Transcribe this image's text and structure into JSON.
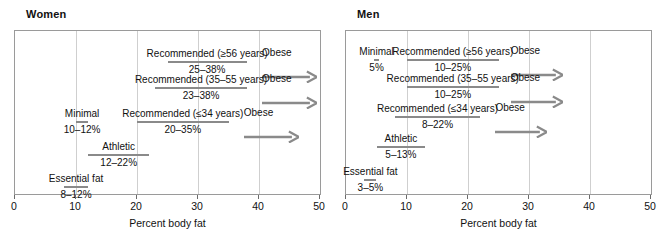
{
  "figure": {
    "axis_title": "Percent body fat",
    "x_ticks": [
      0,
      10,
      20,
      30,
      40,
      50
    ],
    "x_tick_labels": [
      "0",
      "10",
      "20",
      "30",
      "40",
      "50"
    ],
    "gridlines": [
      10,
      20,
      30,
      40
    ],
    "bar_color": "#8a8a8a",
    "frame_color": "#9a9a9a",
    "grid_color": "#cfcfcf"
  },
  "panels": [
    {
      "title": "Women",
      "rows": [
        {
          "label": "Recommended (≥56 years)",
          "value": "25–38%",
          "start": 25,
          "end": 38,
          "obese_label": "Obese",
          "obese_start": 40.5,
          "obese_end": 49.5
        },
        {
          "label": "Recommended (35–55 years)",
          "value": "23–38%",
          "start": 23,
          "end": 38,
          "obese_label": "Obese",
          "obese_start": 40.5,
          "obese_end": 49.5
        },
        {
          "label": "Minimal",
          "value": "10–12%",
          "start": 10,
          "end": 12
        },
        {
          "label": "Recommended (≤34 years)",
          "value": "20–35%",
          "start": 20,
          "end": 35,
          "obese_label": "Obese",
          "obese_start": 37.5,
          "obese_end": 46.5
        },
        {
          "label": "Athletic",
          "value": "12–22%",
          "start": 12,
          "end": 22
        },
        {
          "label": "Essential fat",
          "value": "8–12%",
          "start": 8,
          "end": 12
        }
      ]
    },
    {
      "title": "Men",
      "rows": [
        {
          "label": "Minimal",
          "value": "5%",
          "start": 4.6,
          "end": 5.4
        },
        {
          "label": "Recommended (≥56 years)",
          "value": "10–25%",
          "start": 10,
          "end": 25,
          "obese_label": "Obese",
          "obese_start": 27,
          "obese_end": 35.5
        },
        {
          "label": "Recommended (35–55 years)",
          "value": "10–25%",
          "start": 10,
          "end": 25,
          "obese_label": "Obese",
          "obese_start": 27,
          "obese_end": 35.5
        },
        {
          "label": "Recommended (≤34 years)",
          "value": "8–22%",
          "start": 8,
          "end": 22,
          "obese_label": "Obese",
          "obese_start": 24.5,
          "obese_end": 33
        },
        {
          "label": "Athletic",
          "value": "5–13%",
          "start": 5,
          "end": 13
        },
        {
          "label": "Essential fat",
          "value": "3–5%",
          "start": 3,
          "end": 5
        }
      ]
    }
  ],
  "chart_data": {
    "type": "bar",
    "subtitle": "",
    "xlabel": "Percent body fat",
    "ylabel": "",
    "xlim": [
      0,
      50
    ],
    "grid": true,
    "legend": "none",
    "orientation": "horizontal-ranges",
    "panels": [
      {
        "name": "Women",
        "ranges": [
          {
            "category": "Recommended (≥56 years)",
            "low": 25,
            "high": 38,
            "label": "25–38%"
          },
          {
            "category": "Recommended (35–55 years)",
            "low": 23,
            "high": 38,
            "label": "23–38%"
          },
          {
            "category": "Minimal",
            "low": 10,
            "high": 12,
            "label": "10–12%"
          },
          {
            "category": "Recommended (≤34 years)",
            "low": 20,
            "high": 35,
            "label": "20–35%"
          },
          {
            "category": "Athletic",
            "low": 12,
            "high": 22,
            "label": "12–22%"
          },
          {
            "category": "Essential fat",
            "low": 8,
            "high": 12,
            "label": "8–12%"
          },
          {
            "category": "Obese",
            "low": 38,
            "high": 50,
            "label": "Obese",
            "open_ended": true
          }
        ]
      },
      {
        "name": "Men",
        "ranges": [
          {
            "category": "Minimal",
            "low": 5,
            "high": 5,
            "label": "5%"
          },
          {
            "category": "Recommended (≥56 years)",
            "low": 10,
            "high": 25,
            "label": "10–25%"
          },
          {
            "category": "Recommended (35–55 years)",
            "low": 10,
            "high": 25,
            "label": "10–25%"
          },
          {
            "category": "Recommended (≤34 years)",
            "low": 8,
            "high": 22,
            "label": "8–22%"
          },
          {
            "category": "Athletic",
            "low": 5,
            "high": 13,
            "label": "5–13%"
          },
          {
            "category": "Essential fat",
            "low": 3,
            "high": 5,
            "label": "3–5%"
          },
          {
            "category": "Obese",
            "low": 25,
            "high": 50,
            "label": "Obese",
            "open_ended": true
          }
        ]
      }
    ],
    "xticks": [
      0,
      10,
      20,
      30,
      40,
      50
    ]
  }
}
